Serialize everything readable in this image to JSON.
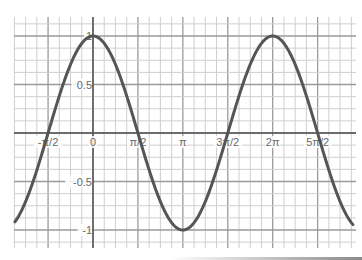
{
  "chart_data": {
    "type": "line",
    "title": "",
    "xlabel": "",
    "ylabel": "",
    "function": "y = cos(x)",
    "series": [
      {
        "name": "cos(x)",
        "color": "#555555",
        "x_range": [
          -2.73,
          9.09
        ]
      }
    ],
    "x_tick_labels": [
      "-π/2",
      "0",
      "π/2",
      "π",
      "3π/2",
      "2π",
      "5π/2"
    ],
    "x_tick_values": [
      -1.5708,
      0,
      1.5708,
      3.1416,
      4.7124,
      6.2832,
      7.854
    ],
    "y_tick_labels": [
      "1",
      "0.5",
      "-0.5",
      "-1"
    ],
    "y_tick_values": [
      1,
      0.5,
      -0.5,
      -1
    ],
    "xlim": [
      -2.73,
      9.09
    ],
    "ylim": [
      -1.13,
      1.13
    ],
    "grid": true,
    "grid_minor_x_step": "π/8",
    "grid_minor_y_step": 0.125,
    "legend": "none",
    "key_points": [
      {
        "x": -1.5708,
        "y": 0
      },
      {
        "x": 0,
        "y": 1
      },
      {
        "x": 1.5708,
        "y": 0
      },
      {
        "x": 3.1416,
        "y": -1
      },
      {
        "x": 4.7124,
        "y": 0
      },
      {
        "x": 6.2832,
        "y": 1
      },
      {
        "x": 7.854,
        "y": 0
      }
    ]
  },
  "colors": {
    "curve": "#555555",
    "axis": "#555555",
    "grid_major": "#9a9a9a",
    "grid_minor": "#cfcfcf",
    "label": "#6a6a6a"
  }
}
